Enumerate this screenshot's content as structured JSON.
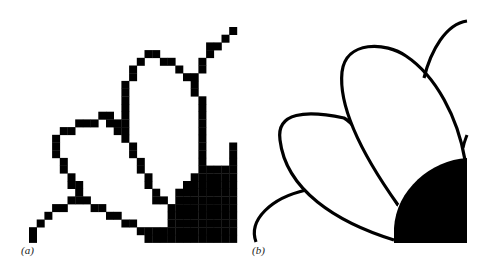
{
  "figure": {
    "panels": [
      {
        "id": "a",
        "label": "(a)",
        "description": "Rasterized (pixelated) rendering of flower petals"
      },
      {
        "id": "b",
        "label": "(b)",
        "description": "Vector (smooth outline) rendering of flower petals"
      }
    ],
    "colors": {
      "ink": "#000000",
      "background": "#ffffff"
    },
    "raster": {
      "cell_size": 7.7,
      "origin": [
        29,
        27
      ],
      "cells": [
        [
          26,
          0
        ],
        [
          25,
          1
        ],
        [
          24,
          2
        ],
        [
          23,
          2
        ],
        [
          15,
          3
        ],
        [
          16,
          3
        ],
        [
          23,
          3
        ],
        [
          14,
          4
        ],
        [
          17,
          4
        ],
        [
          18,
          4
        ],
        [
          22,
          4
        ],
        [
          13,
          5
        ],
        [
          19,
          5
        ],
        [
          22,
          5
        ],
        [
          13,
          6
        ],
        [
          20,
          6
        ],
        [
          21,
          6
        ],
        [
          12,
          7
        ],
        [
          21,
          7
        ],
        [
          12,
          8
        ],
        [
          21,
          8
        ],
        [
          12,
          9
        ],
        [
          22,
          9
        ],
        [
          12,
          10
        ],
        [
          22,
          10
        ],
        [
          9,
          11
        ],
        [
          10,
          11
        ],
        [
          12,
          11
        ],
        [
          22,
          11
        ],
        [
          6,
          12
        ],
        [
          7,
          12
        ],
        [
          8,
          12
        ],
        [
          10,
          12
        ],
        [
          11,
          12
        ],
        [
          12,
          12
        ],
        [
          22,
          12
        ],
        [
          4,
          13
        ],
        [
          5,
          13
        ],
        [
          11,
          13
        ],
        [
          12,
          13
        ],
        [
          22,
          13
        ],
        [
          3,
          14
        ],
        [
          12,
          14
        ],
        [
          22,
          14
        ],
        [
          3,
          15
        ],
        [
          13,
          15
        ],
        [
          22,
          15
        ],
        [
          26,
          15
        ],
        [
          3,
          16
        ],
        [
          13,
          16
        ],
        [
          22,
          16
        ],
        [
          26,
          16
        ],
        [
          4,
          17
        ],
        [
          14,
          17
        ],
        [
          22,
          17
        ],
        [
          26,
          17
        ],
        [
          4,
          18
        ],
        [
          14,
          18
        ],
        [
          22,
          18
        ],
        [
          23,
          18
        ],
        [
          24,
          18
        ],
        [
          25,
          18
        ],
        [
          26,
          18
        ],
        [
          5,
          19
        ],
        [
          15,
          19
        ],
        [
          21,
          19
        ],
        [
          22,
          19
        ],
        [
          23,
          19
        ],
        [
          24,
          19
        ],
        [
          25,
          19
        ],
        [
          26,
          19
        ],
        [
          5,
          20
        ],
        [
          6,
          20
        ],
        [
          15,
          20
        ],
        [
          20,
          20
        ],
        [
          21,
          20
        ],
        [
          22,
          20
        ],
        [
          23,
          20
        ],
        [
          24,
          20
        ],
        [
          25,
          20
        ],
        [
          26,
          20
        ],
        [
          6,
          21
        ],
        [
          16,
          21
        ],
        [
          19,
          21
        ],
        [
          20,
          21
        ],
        [
          21,
          21
        ],
        [
          22,
          21
        ],
        [
          23,
          21
        ],
        [
          24,
          21
        ],
        [
          25,
          21
        ],
        [
          26,
          21
        ],
        [
          5,
          22
        ],
        [
          6,
          22
        ],
        [
          7,
          22
        ],
        [
          16,
          22
        ],
        [
          17,
          22
        ],
        [
          19,
          22
        ],
        [
          20,
          22
        ],
        [
          21,
          22
        ],
        [
          22,
          22
        ],
        [
          23,
          22
        ],
        [
          24,
          22
        ],
        [
          25,
          22
        ],
        [
          26,
          22
        ],
        [
          4,
          23
        ],
        [
          3,
          23
        ],
        [
          8,
          23
        ],
        [
          9,
          23
        ],
        [
          18,
          23
        ],
        [
          19,
          23
        ],
        [
          20,
          23
        ],
        [
          21,
          23
        ],
        [
          22,
          23
        ],
        [
          23,
          23
        ],
        [
          24,
          23
        ],
        [
          25,
          23
        ],
        [
          26,
          23
        ],
        [
          2,
          24
        ],
        [
          10,
          24
        ],
        [
          11,
          24
        ],
        [
          18,
          24
        ],
        [
          19,
          24
        ],
        [
          20,
          24
        ],
        [
          21,
          24
        ],
        [
          22,
          24
        ],
        [
          23,
          24
        ],
        [
          24,
          24
        ],
        [
          25,
          24
        ],
        [
          26,
          24
        ],
        [
          1,
          25
        ],
        [
          12,
          25
        ],
        [
          13,
          25
        ],
        [
          18,
          25
        ],
        [
          19,
          25
        ],
        [
          20,
          25
        ],
        [
          21,
          25
        ],
        [
          22,
          25
        ],
        [
          23,
          25
        ],
        [
          24,
          25
        ],
        [
          25,
          25
        ],
        [
          26,
          25
        ],
        [
          0,
          26
        ],
        [
          14,
          26
        ],
        [
          15,
          26
        ],
        [
          16,
          26
        ],
        [
          17,
          26
        ],
        [
          18,
          26
        ],
        [
          19,
          26
        ],
        [
          20,
          26
        ],
        [
          21,
          26
        ],
        [
          22,
          26
        ],
        [
          23,
          26
        ],
        [
          24,
          26
        ],
        [
          25,
          26
        ],
        [
          26,
          26
        ],
        [
          0,
          27
        ],
        [
          15,
          27
        ],
        [
          16,
          27
        ],
        [
          17,
          27
        ],
        [
          18,
          27
        ],
        [
          19,
          27
        ],
        [
          20,
          27
        ],
        [
          21,
          27
        ],
        [
          22,
          27
        ],
        [
          23,
          27
        ],
        [
          24,
          27
        ],
        [
          25,
          27
        ],
        [
          26,
          27
        ]
      ]
    }
  }
}
